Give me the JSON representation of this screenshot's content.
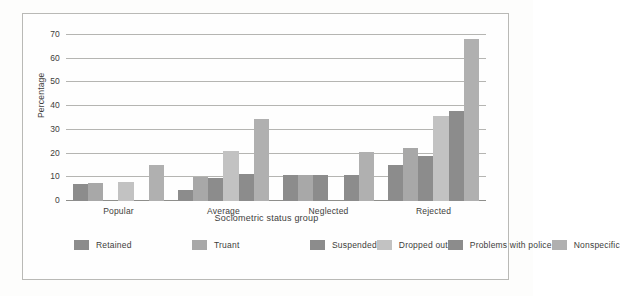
{
  "chart_data": {
    "type": "bar",
    "title": "",
    "xlabel": "Sociometric status group",
    "ylabel": "Percentage",
    "categories": [
      "Popular",
      "Average",
      "Neglected",
      "Rejected"
    ],
    "ylim": [
      0,
      70
    ],
    "yticks": [
      0,
      10,
      20,
      30,
      40,
      50,
      60,
      70
    ],
    "ytick_labels": [
      "0",
      "10",
      "20",
      "30",
      "40",
      "50",
      "60",
      "70"
    ],
    "grid": true,
    "legend_position": "bottom-left",
    "series": [
      {
        "name": "Retained",
        "color": "#8c8c8c",
        "values": [
          7,
          4.5,
          11,
          15
        ]
      },
      {
        "name": "Truant",
        "color": "#a8a8a8",
        "values": [
          7.5,
          10,
          11,
          22.5
        ]
      },
      {
        "name": "Suspended",
        "color": "#8c8c8c",
        "values": [
          0,
          9.5,
          11,
          19
        ]
      },
      {
        "name": "Dropped out",
        "color": "#c2c2c2",
        "values": [
          8,
          21,
          0,
          36
        ]
      },
      {
        "name": "Problems with police",
        "color": "#8c8c8c",
        "values": [
          0,
          11.5,
          11,
          38
        ]
      },
      {
        "name": "Nonspecific",
        "color": "#b0b0b0",
        "values": [
          15,
          34.5,
          20.5,
          68.5
        ]
      }
    ]
  },
  "legend": {
    "items": [
      {
        "label": "Retained",
        "color": "#8c8c8c"
      },
      {
        "label": "Truant",
        "color": "#a8a8a8"
      },
      {
        "label": "Suspended",
        "color": "#8c8c8c"
      },
      {
        "label": "Dropped out",
        "color": "#c2c2c2"
      },
      {
        "label": "Problems with police",
        "color": "#8c8c8c"
      },
      {
        "label": "Nonspecific",
        "color": "#b0b0b0"
      }
    ]
  }
}
